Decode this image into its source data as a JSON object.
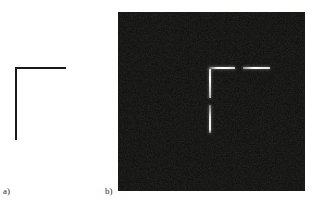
{
  "figure": {
    "background_color": "#ffffff",
    "width": 313,
    "height": 209,
    "panels": [
      {
        "id": "panel-a",
        "caption": "a)",
        "caption_x": 3,
        "caption_y": 186,
        "type": "line-drawing",
        "background_color": "#ffffff",
        "stroke_color": "#1a1a1a",
        "description": "Ideal L-shaped corner stimulus drawn as two black line segments on a white field",
        "segments": [
          {
            "name": "horizontal-arm",
            "orientation": "horizontal",
            "x": 15,
            "y": 67,
            "length": 51,
            "thickness": 2.0
          },
          {
            "name": "vertical-arm",
            "orientation": "vertical",
            "x": 15,
            "y": 67,
            "length": 73,
            "thickness": 2.0
          }
        ]
      },
      {
        "id": "panel-b",
        "caption": "b)",
        "caption_x": 105,
        "caption_y": 186,
        "type": "noisy-image",
        "background_color": "#0b0b0b",
        "stroke_color": "#f2f2ea",
        "frame": {
          "x": 118,
          "y": 12,
          "width": 187,
          "height": 179
        },
        "description": "Same corner rendered as bright response lines on a dark noisy background, with a gap in each arm",
        "segments": [
          {
            "name": "horizontal-arm-left",
            "orientation": "horizontal",
            "x": 209,
            "y": 68,
            "length": 26,
            "thickness": 2.2,
            "peak_brightness": "#ffffff"
          },
          {
            "name": "horizontal-arm-right",
            "orientation": "horizontal",
            "x": 243,
            "y": 68,
            "length": 27,
            "thickness": 2.2,
            "peak_brightness": "#f6f6f0"
          },
          {
            "name": "vertical-arm-upper",
            "orientation": "vertical",
            "x": 209,
            "y": 70,
            "length": 29,
            "thickness": 2.0,
            "peak_brightness": "#fbfbf5"
          },
          {
            "name": "vertical-arm-lower",
            "orientation": "vertical",
            "x": 209,
            "y": 105,
            "length": 28,
            "thickness": 2.0,
            "peak_brightness": "#f2f2ec"
          }
        ]
      }
    ]
  }
}
